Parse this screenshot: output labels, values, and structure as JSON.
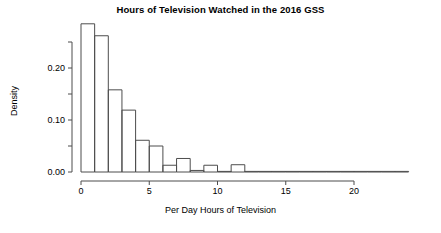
{
  "chart_data": {
    "type": "bar",
    "title": "Hours of Television Watched in the 2016 GSS",
    "xlabel": "Per Day Hours of Television",
    "ylabel": "Density",
    "xlim": [
      0,
      24
    ],
    "ylim": [
      0,
      0.285
    ],
    "grid": false,
    "legend": null,
    "bin_width": 1,
    "xticks": [
      0,
      5,
      10,
      15,
      20
    ],
    "xtick_labels": [
      "0",
      "5",
      "10",
      "15",
      "20"
    ],
    "yticks": [
      0.0,
      0.05,
      0.1,
      0.15,
      0.2,
      0.25
    ],
    "ytick_labels": [
      "0.00",
      "",
      "0.10",
      "",
      "0.20",
      ""
    ],
    "bin_starts": [
      0,
      1,
      2,
      3,
      4,
      5,
      6,
      7,
      8,
      9,
      10,
      11,
      12,
      13,
      14,
      15,
      16,
      17,
      18,
      19,
      20,
      21,
      22,
      23
    ],
    "categories": [
      "0-1",
      "1-2",
      "2-3",
      "3-4",
      "4-5",
      "5-6",
      "6-7",
      "7-8",
      "8-9",
      "9-10",
      "10-11",
      "11-12",
      "12-13",
      "13-14",
      "14-15",
      "15-16",
      "16-17",
      "17-18",
      "18-19",
      "19-20",
      "20-21",
      "21-22",
      "22-23",
      "23-24"
    ],
    "values": [
      0.285,
      0.262,
      0.158,
      0.119,
      0.061,
      0.05,
      0.013,
      0.026,
      0.003,
      0.013,
      0.001,
      0.014,
      0.001,
      0.0,
      0.001,
      0.001,
      0.0,
      0.0,
      0.0,
      0.001,
      0.0,
      0.0,
      0.0,
      0.001
    ]
  }
}
